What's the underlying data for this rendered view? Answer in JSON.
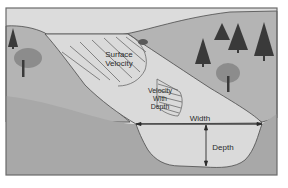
{
  "diagram": {
    "labels": {
      "surface_velocity_line1": "Surface",
      "surface_velocity_line2": "Velocity",
      "velocity_depth_line1": "Velocity",
      "velocity_depth_line2": "With",
      "velocity_depth_line3": "Depth",
      "width": "Width",
      "depth": "Depth"
    },
    "colors": {
      "frame": "#6a6a6a",
      "sky": "#dcdcdc",
      "hill": "#b4b4b4",
      "ground": "#a8a8a8",
      "water": "#dadada",
      "outline": "#4a4a4a",
      "tree_dark": "#3a3a3a",
      "tree_light": "#8c8c8c"
    }
  }
}
